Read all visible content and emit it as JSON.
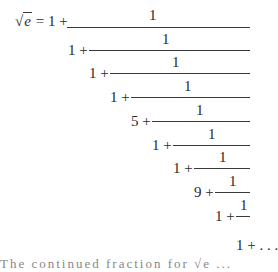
{
  "equation": {
    "lhs": "e",
    "radical": "√",
    "equals": "=",
    "leading_term": "1 +",
    "numerator": "1",
    "terms": [
      "1 +",
      "1 +",
      "1 +",
      "5 +",
      "1 +",
      "1 +",
      "9 +",
      "1 +"
    ],
    "final_term": "1 + . . .",
    "description": "Continued fraction expansion of the square root of e"
  },
  "clipped_text": "The continued fraction for √e ..."
}
